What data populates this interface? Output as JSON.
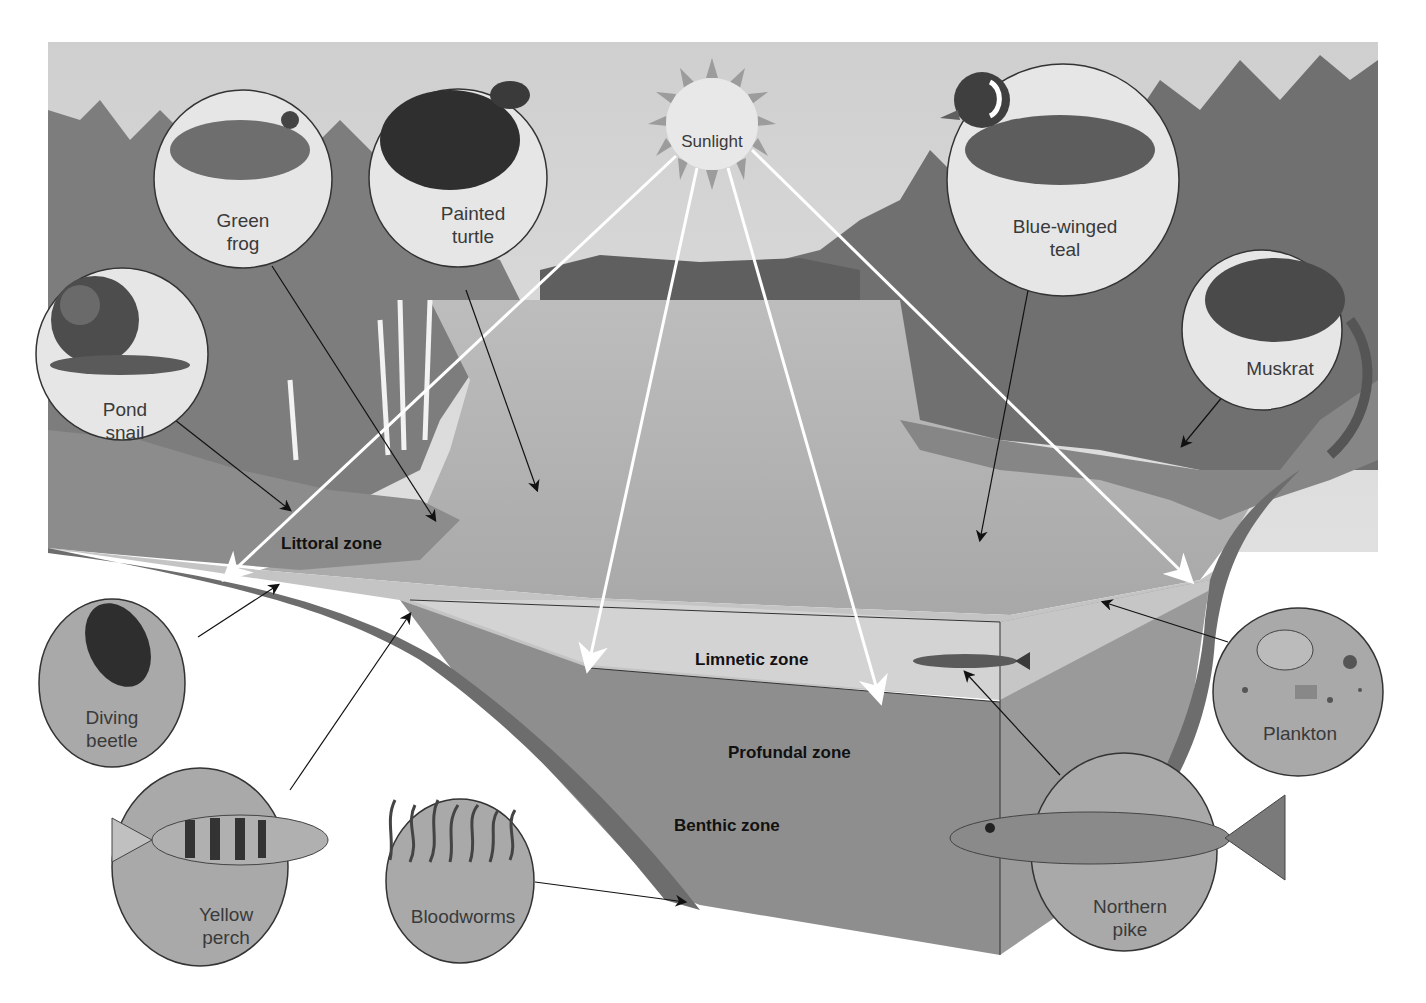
{
  "diagram": {
    "sun": {
      "label": "Sunlight"
    },
    "zones": [
      {
        "id": "littoral",
        "label": "Littoral zone"
      },
      {
        "id": "limnetic",
        "label": "Limnetic zone"
      },
      {
        "id": "profundal",
        "label": "Profundal zone"
      },
      {
        "id": "benthic",
        "label": "Benthic zone"
      }
    ],
    "organisms": [
      {
        "id": "green-frog",
        "line1": "Green",
        "line2": "frog"
      },
      {
        "id": "painted-turtle",
        "line1": "Painted",
        "line2": "turtle"
      },
      {
        "id": "pond-snail",
        "line1": "Pond",
        "line2": "snail"
      },
      {
        "id": "blue-winged-teal",
        "line1": "Blue-winged",
        "line2": "teal"
      },
      {
        "id": "muskrat",
        "line1": "Muskrat",
        "line2": ""
      },
      {
        "id": "diving-beetle",
        "line1": "Diving",
        "line2": "beetle"
      },
      {
        "id": "yellow-perch",
        "line1": "Yellow",
        "line2": "perch"
      },
      {
        "id": "bloodworms",
        "line1": "Bloodworms",
        "line2": ""
      },
      {
        "id": "plankton",
        "line1": "Plankton",
        "line2": ""
      },
      {
        "id": "northern-pike",
        "line1": "Northern",
        "line2": "pike"
      }
    ],
    "colors": {
      "sky": "#d4d4d4",
      "forest": "#7a7a7a",
      "water_surface": "#b8b8b8",
      "limnetic": "#cfcfcf",
      "profundal": "#8f8f8f",
      "light_circle": "#e6e6e6",
      "dark_circle": "#a9a9a9",
      "sun_rays": "#9a9a9a"
    }
  }
}
